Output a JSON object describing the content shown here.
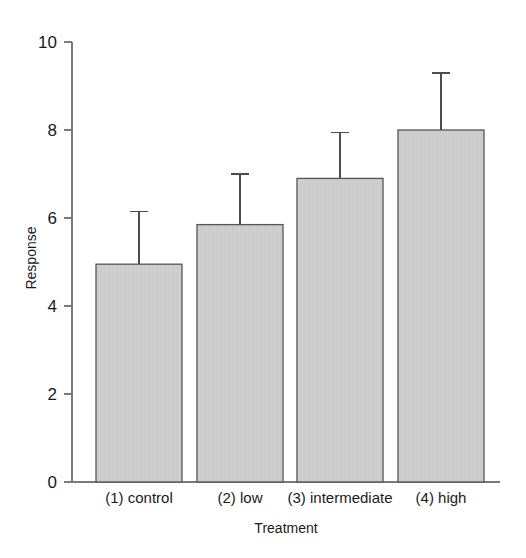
{
  "chart_data": {
    "type": "bar",
    "title": "",
    "subtitle": "",
    "xlabel": "Treatment",
    "ylabel": "Response",
    "categories": [
      "(1) control",
      "(2) low",
      "(3) intermediate",
      "(4) high"
    ],
    "values": [
      4.95,
      5.85,
      6.9,
      8.0
    ],
    "error_upper": [
      1.2,
      1.15,
      1.05,
      1.3
    ],
    "error_bar_tops": [
      6.15,
      7.0,
      7.95,
      9.3
    ],
    "error_bar_style": "upper-only",
    "ylim": [
      0,
      10
    ],
    "yticks": [
      0,
      2,
      4,
      6,
      8,
      10
    ],
    "ytick_labels": [
      "0",
      "2",
      "4",
      "6",
      "8",
      "10"
    ],
    "grid": false,
    "legend": false,
    "legend_position": "none",
    "series": [
      {
        "name": "Response",
        "values": [
          4.95,
          5.85,
          6.9,
          8.0
        ]
      }
    ],
    "colors": {
      "bar_fill": "#cdcdcd",
      "bar_edge": "#555555",
      "axis": "#7a7a7a",
      "error_bar": "#4d4d4d",
      "text": "#1a1a1a",
      "background": "#ffffff"
    },
    "geometry": {
      "plot_left": 72,
      "plot_right": 500,
      "baseline_y": 482,
      "top_y": 42,
      "px_per_unit": 44,
      "bar_width": 86,
      "bar_lefts": [
        96,
        197,
        297,
        398
      ],
      "cat_label_y": 503,
      "xlabel_y": 533
    }
  }
}
